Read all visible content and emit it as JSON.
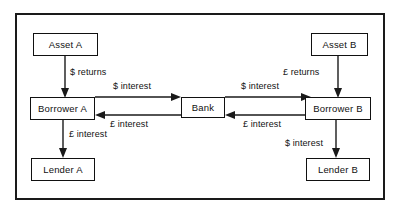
{
  "diagram": {
    "frame_color": "#1a1a1a",
    "nodes": [
      {
        "id": "asset-a",
        "label": "Asset A"
      },
      {
        "id": "borrower-a",
        "label": "Borrower A"
      },
      {
        "id": "lender-a",
        "label": "Lender A"
      },
      {
        "id": "bank",
        "label": "Bank"
      },
      {
        "id": "asset-b",
        "label": "Asset B"
      },
      {
        "id": "borrower-b",
        "label": "Borrower B"
      },
      {
        "id": "lender-b",
        "label": "Lender B"
      }
    ],
    "edges": [
      {
        "id": "asset-a-to-borrower-a",
        "label": "$ returns",
        "from": "Asset A",
        "to": "Borrower A",
        "direction": "down"
      },
      {
        "id": "borrower-a-to-bank",
        "label": "$ interest",
        "from": "Borrower A",
        "to": "Bank",
        "direction": "right"
      },
      {
        "id": "bank-to-borrower-b",
        "label": "$ interest",
        "from": "Bank",
        "to": "Borrower B",
        "direction": "right"
      },
      {
        "id": "borrower-b-to-bank",
        "label": "£ interest",
        "from": "Borrower B",
        "to": "Bank",
        "direction": "left"
      },
      {
        "id": "bank-to-borrower-a",
        "label": "£ interest",
        "from": "Bank",
        "to": "Borrower A",
        "direction": "left"
      },
      {
        "id": "borrower-a-to-lender-a",
        "label": "£ interest",
        "from": "Borrower A",
        "to": "Lender A",
        "direction": "down"
      },
      {
        "id": "asset-b-to-borrower-b",
        "label": "£ returns",
        "from": "Asset B",
        "to": "Borrower B",
        "direction": "down"
      },
      {
        "id": "borrower-b-to-lender-b",
        "label": "$ interest",
        "from": "Borrower B",
        "to": "Lender B",
        "direction": "down"
      }
    ]
  }
}
